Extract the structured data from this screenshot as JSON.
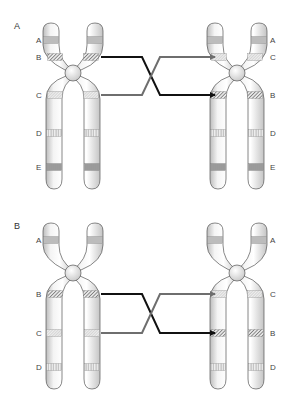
{
  "figure": {
    "background": "#ffffff",
    "colors": {
      "chromatid_fill": "#f7f7f7",
      "chromatid_shade": "#c9c9c9",
      "chromatid_outline": "#555555",
      "band_stripe": "#555555",
      "arrow_black": "#111111",
      "arrow_gray": "#6e6e6e",
      "label_text": "#333333"
    }
  },
  "panels": [
    {
      "id": "A",
      "label": "A",
      "label_pos": [
        14,
        29
      ],
      "chromosomes": [
        {
          "name": "original",
          "center_x": 73,
          "centromere_y": 73,
          "top_y": 23,
          "bottom_y": 189,
          "label_side": "left",
          "label_x": 36,
          "bands": [
            {
              "label": "A",
              "y": 40,
              "pattern": "horizontal"
            },
            {
              "label": "B",
              "y": 57,
              "pattern": "diagonal"
            },
            {
              "label": "C",
              "y": 95,
              "pattern": "dotted"
            },
            {
              "label": "D",
              "y": 133,
              "pattern": "vertical"
            },
            {
              "label": "E",
              "y": 167,
              "pattern": "vertical-dense"
            }
          ]
        },
        {
          "name": "inverted",
          "center_x": 237,
          "centromere_y": 73,
          "top_y": 23,
          "bottom_y": 189,
          "label_side": "right",
          "label_x": 270,
          "bands": [
            {
              "label": "A",
              "y": 40,
              "pattern": "horizontal"
            },
            {
              "label": "C",
              "y": 57,
              "pattern": "dotted"
            },
            {
              "label": "B",
              "y": 95,
              "pattern": "diagonal"
            },
            {
              "label": "D",
              "y": 133,
              "pattern": "vertical"
            },
            {
              "label": "E",
              "y": 167,
              "pattern": "vertical-dense"
            }
          ]
        }
      ],
      "arrows": [
        {
          "from_band": "B",
          "to_band": "B",
          "color": "arrow_black",
          "y_start": 57,
          "y_end": 95
        },
        {
          "from_band": "C",
          "to_band": "C",
          "color": "arrow_gray",
          "y_start": 95,
          "y_end": 57
        }
      ]
    },
    {
      "id": "B",
      "label": "B",
      "label_pos": [
        14,
        229
      ],
      "chromosomes": [
        {
          "name": "original",
          "center_x": 73,
          "centromere_y": 273,
          "top_y": 223,
          "bottom_y": 389,
          "label_side": "left",
          "label_x": 36,
          "bands": [
            {
              "label": "A",
              "y": 240,
              "pattern": "horizontal"
            },
            {
              "label": "B",
              "y": 294,
              "pattern": "diagonal"
            },
            {
              "label": "C",
              "y": 333,
              "pattern": "dotted"
            },
            {
              "label": "D",
              "y": 367,
              "pattern": "vertical"
            }
          ]
        },
        {
          "name": "inverted",
          "center_x": 237,
          "centromere_y": 273,
          "top_y": 223,
          "bottom_y": 389,
          "label_side": "right",
          "label_x": 270,
          "bands": [
            {
              "label": "A",
              "y": 240,
              "pattern": "horizontal"
            },
            {
              "label": "C",
              "y": 294,
              "pattern": "dotted"
            },
            {
              "label": "B",
              "y": 333,
              "pattern": "diagonal"
            },
            {
              "label": "D",
              "y": 367,
              "pattern": "vertical"
            }
          ]
        }
      ],
      "arrows": [
        {
          "from_band": "B",
          "to_band": "B",
          "color": "arrow_black",
          "y_start": 294,
          "y_end": 333
        },
        {
          "from_band": "C",
          "to_band": "C",
          "color": "arrow_gray",
          "y_start": 333,
          "y_end": 294
        }
      ]
    }
  ]
}
